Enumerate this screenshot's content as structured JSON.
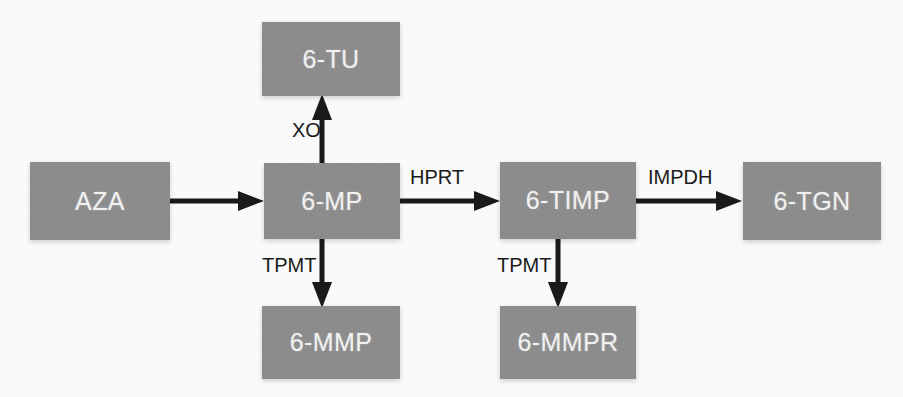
{
  "diagram": {
    "colors": {
      "node_fill": "#8e8e8e",
      "node_text": "#f4f4f4",
      "edge": "#1b1b1b",
      "background": "#fdfdfd"
    },
    "nodes": [
      {
        "id": "aza",
        "label": "AZA",
        "x": 30,
        "y": 162,
        "w": 140,
        "h": 78
      },
      {
        "id": "6tu",
        "label": "6-TU",
        "x": 262,
        "y": 22,
        "w": 138,
        "h": 74
      },
      {
        "id": "6mp",
        "label": "6-MP",
        "x": 264,
        "y": 163,
        "w": 136,
        "h": 76
      },
      {
        "id": "6mmp",
        "label": "6-MMP",
        "x": 262,
        "y": 306,
        "w": 138,
        "h": 73
      },
      {
        "id": "6timp",
        "label": "6-TIMP",
        "x": 500,
        "y": 162,
        "w": 136,
        "h": 77
      },
      {
        "id": "6mmpr",
        "label": "6-MMPR",
        "x": 500,
        "y": 306,
        "w": 136,
        "h": 73
      },
      {
        "id": "6tgn",
        "label": "6-TGN",
        "x": 743,
        "y": 162,
        "w": 138,
        "h": 78
      }
    ],
    "edges": [
      {
        "id": "aza-6mp",
        "from": "AZA",
        "to": "6-MP",
        "label": "",
        "direction": "right"
      },
      {
        "id": "6mp-6tu",
        "from": "6-MP",
        "to": "6-TU",
        "label": "XO",
        "direction": "up"
      },
      {
        "id": "6mp-6mmp",
        "from": "6-MP",
        "to": "6-MMP",
        "label": "TPMT",
        "direction": "down"
      },
      {
        "id": "6mp-6timp",
        "from": "6-MP",
        "to": "6-TIMP",
        "label": "HPRT",
        "direction": "right"
      },
      {
        "id": "6timp-6mmpr",
        "from": "6-TIMP",
        "to": "6-MMPR",
        "label": "TPMT",
        "direction": "down"
      },
      {
        "id": "6timp-6tgn",
        "from": "6-TIMP",
        "to": "6-TGN",
        "label": "IMPDH",
        "direction": "right"
      }
    ],
    "edge_labels": {
      "xo": {
        "text": "XO",
        "x": 292,
        "y": 119
      },
      "hprt": {
        "text": "HPRT",
        "x": 410,
        "y": 166
      },
      "impdh": {
        "text": "IMPDH",
        "x": 648,
        "y": 166
      },
      "tpmt_left": {
        "text": "TPMT",
        "x": 262,
        "y": 254
      },
      "tpmt_right": {
        "text": "TPMT",
        "x": 497,
        "y": 254
      }
    }
  }
}
